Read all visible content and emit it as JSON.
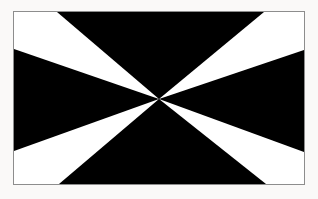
{
  "image": {
    "kind": "flag-emblem",
    "title": "Black flag with four white radiating wedges",
    "alt_text": "Rectangular black flag bordered by a thin grey frame, with four white triangular wedges radiating outward from a single convergence point toward the four corners",
    "canvas": {
      "width": 318,
      "height": 199
    },
    "background_color": "#faf9f8"
  },
  "frame": {
    "name": "flag-border",
    "x": 13,
    "y": 11,
    "width": 292,
    "height": 174,
    "border_color": "#8d8d8d",
    "border_width": 1
  },
  "flag": {
    "field_color": "#000000",
    "wedge_color": "#ffffff",
    "inner_width": 290,
    "inner_height": 172,
    "convergence_point": {
      "x": 145,
      "y": 87
    },
    "wedges": [
      {
        "name": "wedge-top-left",
        "label": "Top-left white wedge",
        "points": "0,0 43,0 145,87 0,37"
      },
      {
        "name": "wedge-top-right",
        "label": "Top-right white wedge",
        "points": "250,0 290,0 290,38 145,87"
      },
      {
        "name": "wedge-bottom-left",
        "label": "Bottom-left white wedge",
        "points": "145,87 0,139 0,172 45,172"
      },
      {
        "name": "wedge-bottom-right",
        "label": "Bottom-right white wedge",
        "points": "145,87 290,140 290,172 252,172"
      }
    ]
  }
}
